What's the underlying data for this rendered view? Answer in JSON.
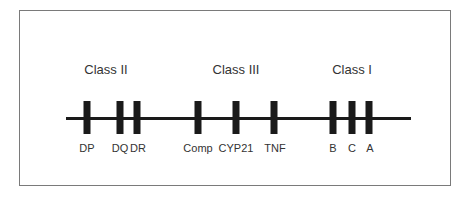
{
  "diagram": {
    "classes": [
      {
        "label": "Class II",
        "x": 106
      },
      {
        "label": "Class III",
        "x": 236
      },
      {
        "label": "Class I",
        "x": 352
      }
    ],
    "genes": [
      {
        "label": "DP",
        "x": 87
      },
      {
        "label": "DQ",
        "x": 120
      },
      {
        "label": "DR",
        "x": 137
      },
      {
        "label": "Comp",
        "x": 198
      },
      {
        "label": "CYP21",
        "x": 236
      },
      {
        "label": "TNF",
        "x": 274
      },
      {
        "label": "B",
        "x": 333
      },
      {
        "label": "C",
        "x": 352
      },
      {
        "label": "A",
        "x": 369
      }
    ],
    "colors": {
      "bar": "#1a1a1a",
      "text": "#333333",
      "frame": "#7a7a7a"
    }
  }
}
